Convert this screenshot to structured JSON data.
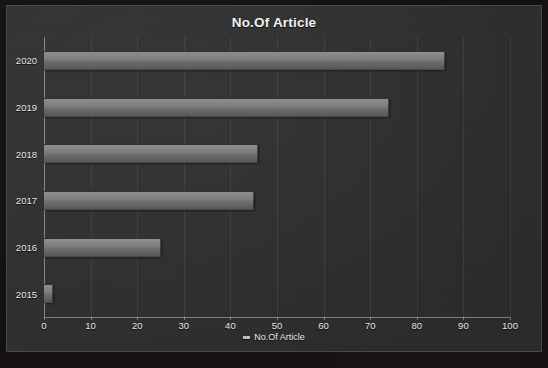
{
  "chart_data": {
    "type": "bar",
    "orientation": "horizontal",
    "title": "No.Of Article",
    "xlabel": "",
    "ylabel": "",
    "categories": [
      "2015",
      "2016",
      "2017",
      "2018",
      "2019",
      "2020"
    ],
    "values": [
      2,
      25,
      45,
      46,
      74,
      86
    ],
    "series": [
      {
        "name": "No.Of Article",
        "values": [
          2,
          25,
          45,
          46,
          74,
          86
        ]
      }
    ],
    "xlim": [
      0,
      100
    ],
    "xticks": [
      0,
      10,
      20,
      30,
      40,
      50,
      60,
      70,
      80,
      90,
      100
    ],
    "xtick_labels": [
      "0",
      "10",
      "20",
      "30",
      "40",
      "50",
      "60",
      "70",
      "80",
      "90",
      "100"
    ],
    "grid": true,
    "grid_axis": "x",
    "legend": {
      "position": "bottom",
      "entries": [
        {
          "label": "No.Of Article",
          "marker": "legend-marker-dash"
        }
      ]
    },
    "colors": {
      "background": "#2f2f2f",
      "outer_background": "#151110",
      "border": "#4a4a4a",
      "bar_top": "#8e8e8e",
      "bar_bottom": "#585858",
      "text": "#f2f2f2",
      "gridline": "#4f4f4f",
      "axis_line": "#9a9a9a"
    }
  }
}
